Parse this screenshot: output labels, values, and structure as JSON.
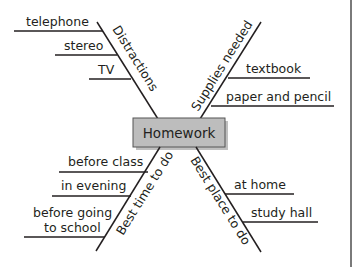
{
  "diagram": {
    "type": "fishbone",
    "center": {
      "label": "Homework",
      "fill": "#bdbdbd",
      "border": "#555555"
    },
    "branches": [
      {
        "id": "distractions",
        "label": "Distractions",
        "position": "top-left",
        "items": [
          "telephone",
          "stereo",
          "TV"
        ]
      },
      {
        "id": "supplies",
        "label": "Supplies needed",
        "position": "top-right",
        "items": [
          "textbook",
          "paper and pencil"
        ]
      },
      {
        "id": "best-time",
        "label": "Best time to do",
        "position": "bottom-left",
        "items": [
          "before class",
          "in evening",
          "before going",
          "to school"
        ]
      },
      {
        "id": "best-place",
        "label": "Best place to do",
        "position": "bottom-right",
        "items": [
          "at home",
          "study hall"
        ]
      }
    ]
  }
}
